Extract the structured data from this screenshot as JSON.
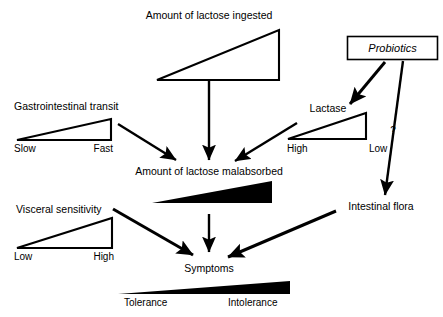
{
  "diagram": {
    "background_color": "#ffffff",
    "ink_color": "#000000",
    "nodes": {
      "lactose_ingested": {
        "label": "Amount of lactose ingested"
      },
      "probiotics": {
        "label": "Probiotics"
      },
      "gi_transit": {
        "label": "Gastrointestinal transit"
      },
      "lactase": {
        "label": "Lactase"
      },
      "lactose_malabsorbed": {
        "label": "Amount of lactose malabsorbed"
      },
      "visceral_sensitivity": {
        "label": "Visceral sensitivity"
      },
      "intestinal_flora": {
        "label": "Intestinal flora"
      },
      "symptoms": {
        "label": "Symptoms"
      }
    },
    "scales": {
      "gi_transit": {
        "left": "Slow",
        "right": "Fast"
      },
      "lactase": {
        "left": "High",
        "right": "Low"
      },
      "visceral_sensitivity": {
        "left": "Low",
        "right": "High"
      },
      "tolerance": {
        "left": "Tolerance",
        "right": "Intolerance"
      }
    },
    "annotations": {
      "uncertain_edge": "?"
    },
    "edges": [
      {
        "from": "lactose_ingested",
        "to": "lactose_malabsorbed",
        "style": "solid-arrow"
      },
      {
        "from": "gi_transit",
        "to": "lactose_malabsorbed",
        "style": "solid-arrow"
      },
      {
        "from": "lactase",
        "to": "lactose_malabsorbed",
        "style": "solid-arrow"
      },
      {
        "from": "probiotics",
        "to": "lactase",
        "style": "thick-arrow"
      },
      {
        "from": "probiotics",
        "to": "intestinal_flora",
        "style": "solid-arrow",
        "annotation": "?"
      },
      {
        "from": "lactose_malabsorbed",
        "to": "symptoms",
        "style": "solid-arrow"
      },
      {
        "from": "visceral_sensitivity",
        "to": "symptoms",
        "style": "thick-arrow"
      },
      {
        "from": "intestinal_flora",
        "to": "symptoms",
        "style": "thick-arrow"
      }
    ]
  }
}
